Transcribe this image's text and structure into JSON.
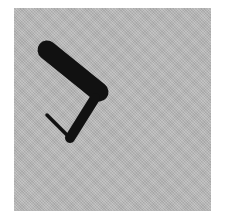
{
  "image": {
    "description": "Black angular figure (thick rounded diagonal bar with a thinner bar and thin line forming a hook) on a gray textured square",
    "colors": {
      "background": "#ffffff",
      "panel": "#b8b8b8",
      "figure": "#111111"
    },
    "parts": [
      "thick-bar",
      "lower-bar",
      "thin-line"
    ]
  }
}
